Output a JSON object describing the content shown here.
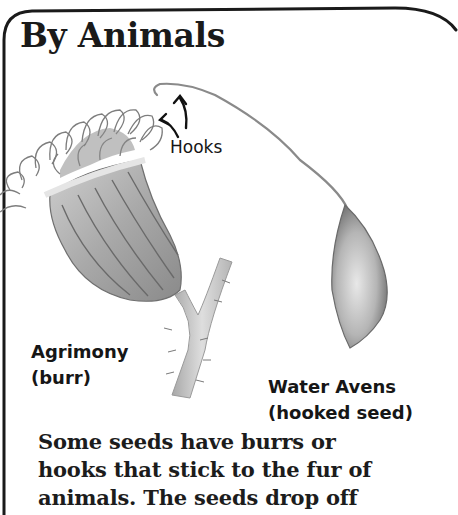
{
  "page": {
    "title": "By Animals",
    "colors": {
      "ink": "#1a1a1a",
      "background": "#ffffff",
      "pencil_shade": "#9a9a9a"
    }
  },
  "illustration": {
    "agrimony": {
      "name": "Agrimony",
      "note": "(burr)"
    },
    "water_avens": {
      "name": "Water Avens",
      "note": "(hooked seed)"
    },
    "hooks_label": "Hooks"
  },
  "body": {
    "lines": [
      "Some seeds have burrs or",
      "hooks that stick to the fur of",
      "animals. The seeds drop off"
    ]
  }
}
